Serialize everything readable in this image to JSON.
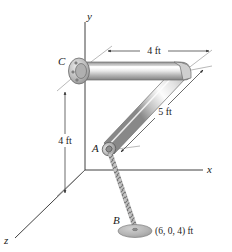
{
  "figure": {
    "type": "engineering-statics-diagram",
    "background_color": "#ffffff",
    "line_color": "#2b2b2b",
    "pipe_color_light": "#f2f2f2",
    "pipe_color_mid": "#c9c9c9",
    "pipe_color_dark": "#8d8d8d",
    "disc_color": "#b9b9b9"
  },
  "axes": {
    "y_label": "y",
    "x_label": "x",
    "z_label": "z"
  },
  "points": {
    "a_label": "A",
    "b_label": "B",
    "c_label": "C"
  },
  "dimensions": {
    "top_horizontal": "4 ft",
    "diagonal": "5 ft",
    "vertical": "4 ft"
  },
  "annotations": {
    "b_coordinate": "(6, 0, 4) ft"
  },
  "icons": {
    "flange": "flange-icon",
    "pipe": "pipe-icon",
    "chain": "chain-icon",
    "anchor_disc": "anchor-disc-icon",
    "arrowhead": "arrowhead-icon"
  }
}
